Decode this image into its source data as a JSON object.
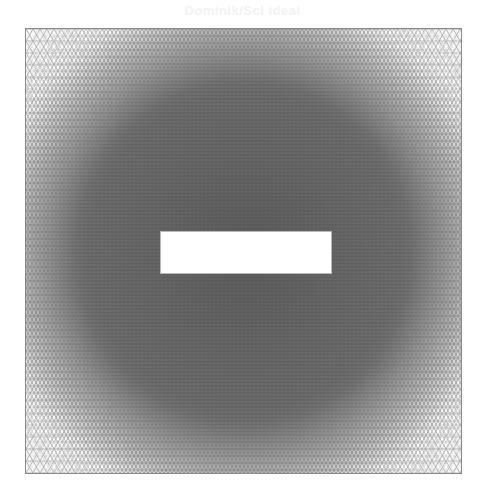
{
  "figure": {
    "ghost_title": "Dominik/Scl ideal",
    "ghost_caption": "",
    "mesh": {
      "type": "unstructured-triangular-mesh",
      "domain_shape": "square",
      "hole_shape": "rectangle",
      "bounds_px": {
        "left": 25,
        "top": 28,
        "right": 462,
        "bottom": 474
      },
      "hole_px": {
        "left": 159,
        "top": 230,
        "right": 331,
        "bottom": 273
      },
      "refinement": "dense near center and around hole, coarser toward corners",
      "colors": {
        "edge_dark": "#3a3a3a",
        "edge_light": "#9a9a9a",
        "background": "#ffffff",
        "hole_fill": "#ffffff"
      }
    }
  }
}
